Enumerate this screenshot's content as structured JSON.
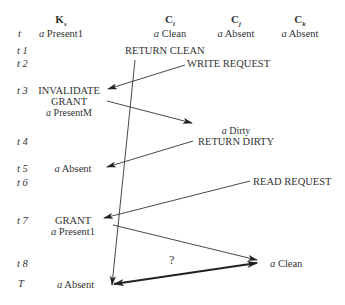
{
  "header": {
    "time_label": "t",
    "columns": [
      {
        "name": "K",
        "subscript": "s",
        "state_prefix": "a",
        "state": "Present1"
      },
      {
        "name": "C",
        "subscript": "i",
        "state_prefix": "a",
        "state": "Clean"
      },
      {
        "name": "C",
        "subscript": "j",
        "state_prefix": "a",
        "state": "Absent"
      },
      {
        "name": "C",
        "subscript": "k",
        "state_prefix": "a",
        "state": "Absent"
      }
    ]
  },
  "time_labels": [
    "t 1",
    "t 2",
    "t 3",
    "t 4",
    "t 5",
    "t 6",
    "t 7",
    "t 8",
    "T"
  ],
  "events": {
    "return_clean": "RETURN CLEAN",
    "write_request": "WRITE REQUEST",
    "invalidate": "INVALIDATE",
    "grant1": "GRANT",
    "present_m_prefix": "a",
    "present_m": "PresentM",
    "dirty_prefix": "a",
    "dirty": "Dirty",
    "return_dirty": "RETURN DIRTY",
    "absent1_prefix": "a",
    "absent1": "Absent",
    "read_request": "READ REQUEST",
    "grant2": "GRANT",
    "present1_prefix": "a",
    "present1": "Present1",
    "question": "?",
    "clean_prefix": "a",
    "clean": "Clean",
    "absent2_prefix": "a",
    "absent2": "Absent"
  }
}
